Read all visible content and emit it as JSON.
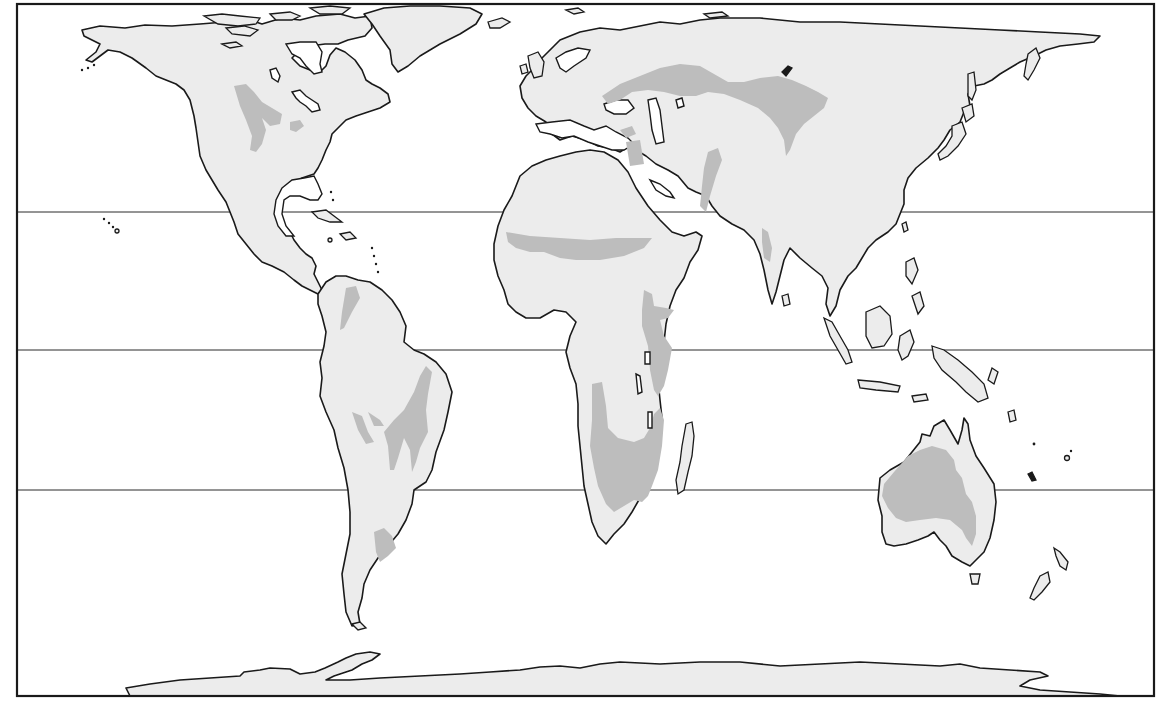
{
  "map": {
    "title": "",
    "projection": "equal-area world map (Peters-style)",
    "colors": {
      "background": "#ffffff",
      "land": "#ececec",
      "shaded_region": "#bdbdbd",
      "outline": "#1a1a1a",
      "latitude_line": "#2a2a2a"
    },
    "frame": {
      "x": 16,
      "y": 3,
      "width": 1139,
      "height": 694
    },
    "latitude_lines_y": [
      212,
      350,
      490
    ],
    "continents": [
      "North America",
      "South America",
      "Europe",
      "Asia",
      "Africa",
      "Australia",
      "Antarctica",
      "Greenland"
    ],
    "shaded_regions": [
      "North American Great Plains",
      "Northern South America (Llanos)",
      "Eastern Brazil",
      "Central Brazil",
      "Argentine Pampas",
      "Sahel belt",
      "East Africa",
      "Southern Africa",
      "Eurasian steppe",
      "Central Asia / Mongolia",
      "Anatolia / Middle East",
      "Arabia",
      "Indian subcontinent",
      "Interior Australia"
    ],
    "labels": []
  }
}
